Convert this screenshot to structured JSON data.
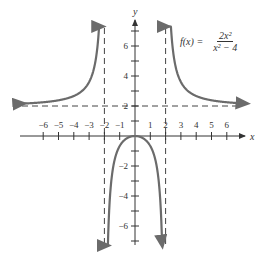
{
  "chart_data": {
    "type": "line",
    "title": "",
    "function_label": "f(x) = 2x^2 / (x^2 - 4)",
    "formula": {
      "lhs": "f(x) =",
      "numerator": "2x²",
      "denominator": "x² − 4"
    },
    "xlabel": "x",
    "ylabel": "y",
    "xlim": [
      -7,
      7
    ],
    "ylim": [
      -7,
      7
    ],
    "x_ticks": [
      -6,
      -5,
      -4,
      -3,
      -2,
      -1,
      1,
      2,
      3,
      4,
      5,
      6
    ],
    "y_tick_labels": [
      6,
      4,
      2,
      -2,
      -4,
      -6
    ],
    "y_ticks": [
      -7,
      -6,
      -5,
      -4,
      -3,
      -2,
      -1,
      1,
      2,
      3,
      4,
      5,
      6,
      7
    ],
    "asymptotes": {
      "vertical": [
        -2,
        2
      ],
      "horizontal": [
        2
      ]
    },
    "grid": false,
    "series": [
      {
        "name": "left branch",
        "x": [
          -7,
          -6,
          -5,
          -4,
          -3,
          -2.5,
          -2.2,
          -2.1
        ],
        "y": [
          2.18,
          2.25,
          2.38,
          2.67,
          3.6,
          5.56,
          11.5,
          21.5
        ]
      },
      {
        "name": "middle branch",
        "x": [
          -1.95,
          -1.9,
          -1.5,
          -1,
          -0.5,
          0,
          0.5,
          1,
          1.5,
          1.9,
          1.95
        ],
        "y": [
          -38.5,
          -18.5,
          -2.57,
          -0.67,
          -0.14,
          0,
          -0.14,
          -0.67,
          -2.57,
          -18.5,
          -38.5
        ]
      },
      {
        "name": "right branch",
        "x": [
          2.1,
          2.2,
          2.5,
          3,
          4,
          5,
          6,
          7
        ],
        "y": [
          21.5,
          11.5,
          5.56,
          3.6,
          2.67,
          2.38,
          2.25,
          2.18
        ]
      }
    ],
    "color": "#6b6b6b"
  }
}
